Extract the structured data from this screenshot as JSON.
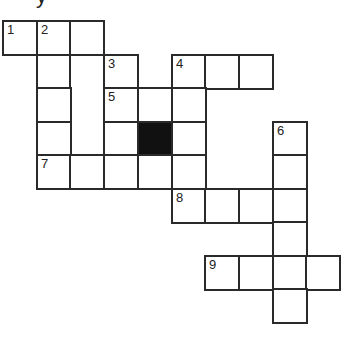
{
  "heading_partial": "y",
  "grid": {
    "origin_x": 3,
    "origin_y": 21,
    "cell_w": 33.7,
    "cell_h": 33.5,
    "colors": {
      "line": "#2a2a2a",
      "fill": "#ffffff",
      "block": "#111111"
    },
    "cells": [
      {
        "r": 0,
        "c": 0,
        "num": "1"
      },
      {
        "r": 0,
        "c": 1,
        "num": "2"
      },
      {
        "r": 0,
        "c": 2
      },
      {
        "r": 1,
        "c": 1
      },
      {
        "r": 1,
        "c": 2,
        "rowspan": 3
      },
      {
        "r": 1,
        "c": 3,
        "num": "3"
      },
      {
        "r": 1,
        "c": 5,
        "num": "4"
      },
      {
        "r": 1,
        "c": 6
      },
      {
        "r": 1,
        "c": 7
      },
      {
        "r": 2,
        "c": 1
      },
      {
        "r": 2,
        "c": 3,
        "num": "5"
      },
      {
        "r": 2,
        "c": 4
      },
      {
        "r": 2,
        "c": 5
      },
      {
        "r": 3,
        "c": 1
      },
      {
        "r": 3,
        "c": 3
      },
      {
        "r": 3,
        "c": 4,
        "black": true
      },
      {
        "r": 3,
        "c": 5
      },
      {
        "r": 3,
        "c": 8,
        "num": "6"
      },
      {
        "r": 4,
        "c": 1,
        "num": "7"
      },
      {
        "r": 4,
        "c": 2
      },
      {
        "r": 4,
        "c": 3
      },
      {
        "r": 4,
        "c": 4
      },
      {
        "r": 4,
        "c": 5
      },
      {
        "r": 4,
        "c": 8
      },
      {
        "r": 5,
        "c": 5,
        "num": "8"
      },
      {
        "r": 5,
        "c": 6
      },
      {
        "r": 5,
        "c": 7
      },
      {
        "r": 5,
        "c": 8
      },
      {
        "r": 6,
        "c": 8
      },
      {
        "r": 7,
        "c": 6,
        "num": "9"
      },
      {
        "r": 7,
        "c": 7
      },
      {
        "r": 7,
        "c": 8
      },
      {
        "r": 7,
        "c": 9
      },
      {
        "r": 8,
        "c": 8
      }
    ]
  }
}
